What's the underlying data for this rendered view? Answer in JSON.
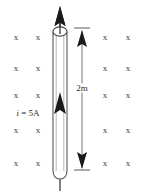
{
  "figure": {
    "background_color": "#ffffff",
    "stroke_color": "#2b2b2b",
    "field_mark_color": "#3a3a3a"
  },
  "labels": {
    "current": {
      "symbol": "i",
      "equals": " = ",
      "value": "5A",
      "full": "i = 5A"
    },
    "length": {
      "value": "2m"
    }
  },
  "field": {
    "symbol": "x",
    "meaning": "magnetic-field-into-page",
    "columns_x": [
      16,
      38,
      105,
      128
    ],
    "rows_y": [
      37,
      68,
      95,
      130,
      163
    ],
    "marks": [
      {
        "x": 16,
        "y": 37
      },
      {
        "x": 38,
        "y": 37
      },
      {
        "x": 105,
        "y": 37
      },
      {
        "x": 128,
        "y": 37
      },
      {
        "x": 16,
        "y": 68
      },
      {
        "x": 38,
        "y": 68
      },
      {
        "x": 105,
        "y": 68
      },
      {
        "x": 128,
        "y": 68
      },
      {
        "x": 16,
        "y": 95
      },
      {
        "x": 38,
        "y": 95
      },
      {
        "x": 105,
        "y": 95
      },
      {
        "x": 128,
        "y": 95
      },
      {
        "x": 16,
        "y": 130
      },
      {
        "x": 38,
        "y": 130
      },
      {
        "x": 105,
        "y": 130
      },
      {
        "x": 128,
        "y": 130
      },
      {
        "x": 16,
        "y": 163
      },
      {
        "x": 38,
        "y": 163
      },
      {
        "x": 105,
        "y": 163
      },
      {
        "x": 128,
        "y": 163
      }
    ]
  },
  "wire": {
    "name": "conducting-wire-cylinder",
    "center_x": 60,
    "top_y": 30,
    "bottom_y": 178,
    "half_width": 7,
    "fill": "#ffffff",
    "stroke": "#4a4a4a"
  },
  "current_arrow": {
    "name": "current-direction-arrow",
    "direction": "up",
    "tip_y": 8,
    "tail_y": 190
  },
  "dimension": {
    "name": "length-dimension-2m",
    "x": 82,
    "top_y": 28,
    "bottom_y": 170,
    "tick_half_width": 8,
    "label_y": 88
  }
}
